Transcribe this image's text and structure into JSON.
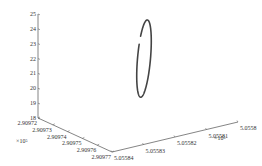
{
  "chart_data": {
    "type": "line",
    "projection": "3d",
    "title": "",
    "xlabel": "",
    "ylabel": "",
    "zlabel": "",
    "x_axis": {
      "ticks": [
        "2.90972",
        "2.90973",
        "2.90974",
        "2.90975",
        "2.90976",
        "2.90977"
      ],
      "range": [
        2.90972,
        2.90977
      ],
      "multiplier": "×10⁵"
    },
    "y_axis": {
      "ticks": [
        "5.05584",
        "5.05583",
        "5.05582",
        "5.05581",
        "5.0558"
      ],
      "range": [
        5.05584,
        5.0558
      ],
      "multiplier": "×10⁵"
    },
    "z_axis": {
      "ticks": [
        "18",
        "19",
        "20",
        "21",
        "22",
        "23",
        "24",
        "25"
      ],
      "range": [
        18,
        25
      ]
    },
    "series": [
      {
        "name": "trajectory",
        "shape": "closed elliptical loop with small gap",
        "z_range": [
          19.4,
          24.6
        ],
        "color": "#444444"
      }
    ],
    "grid": false,
    "legend": "none"
  }
}
